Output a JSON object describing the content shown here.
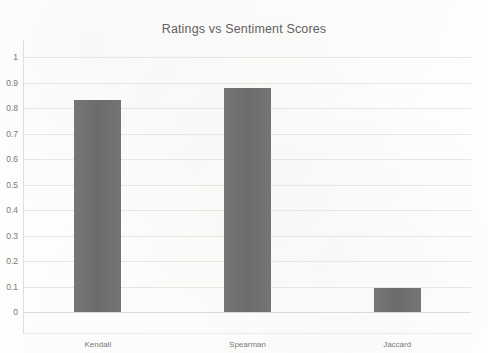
{
  "chart_data": {
    "type": "bar",
    "title": "Ratings vs Sentiment Scores",
    "xlabel": "",
    "ylabel": "",
    "categories": [
      "Kendall",
      "Spearman",
      "Jaccard"
    ],
    "values": [
      0.83,
      0.88,
      0.095
    ],
    "series": [
      {
        "name": "Ratings vs Sentiment Scores",
        "values": [
          0.83,
          0.88,
          0.095
        ]
      }
    ],
    "ylim": [
      0,
      1
    ],
    "yticks": [
      "0",
      "0.1",
      "0.2",
      "0.3",
      "0.4",
      "0.5",
      "0.6",
      "0.7",
      "0.8",
      "0.9",
      "1"
    ],
    "ytick_values": [
      0,
      0.1,
      0.2,
      0.3,
      0.4,
      0.5,
      0.6,
      0.7,
      0.8,
      0.9,
      1
    ],
    "grid": true,
    "grid_axis": "y",
    "legend": false,
    "legend_position": "none",
    "bar_color": "#6f6f6f",
    "title_color": "#63615f",
    "gridline_color": "#e6e6e3",
    "axis_label_color": "#7a7876",
    "background_color": "#fdfdfc"
  }
}
